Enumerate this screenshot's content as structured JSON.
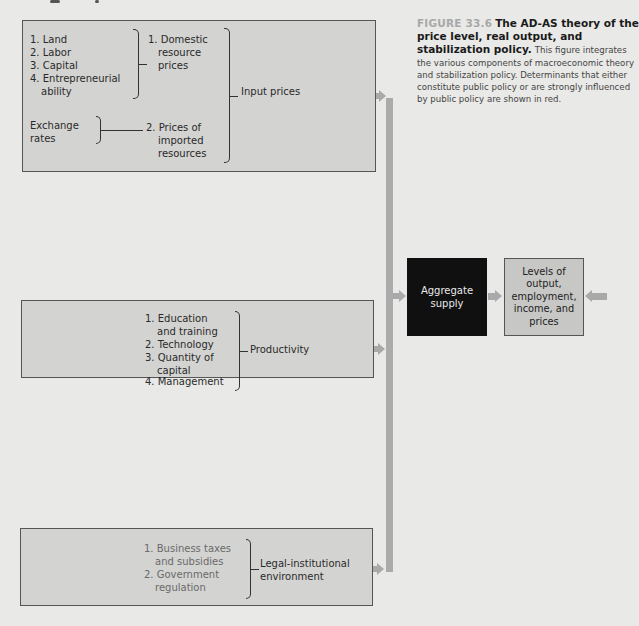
{
  "caption": {
    "figure_label": "FIGURE 33.6",
    "title": "The AD-AS theory of the price level, real output, and stabilization policy.",
    "body": "This figure integrates the various components of macroeconomic theory and stabilization policy. Determinants that either constitute public policy or are strongly influenced by public policy are shown in red."
  },
  "input_prices_box": {
    "resources": [
      "1. Land",
      "2. Labor",
      "3. Capital",
      "4. Entrepreneurial",
      "ability"
    ],
    "domestic_prices": [
      "1. Domestic",
      "resource",
      "prices"
    ],
    "exchange_rates": [
      "Exchange",
      "rates"
    ],
    "imported_prices": [
      "2. Prices of",
      "imported",
      "resources"
    ],
    "label": "Input prices"
  },
  "productivity_box": {
    "items": [
      "1. Education",
      "and training",
      "2. Technology",
      "3. Quantity of",
      "capital",
      "4. Management"
    ],
    "label": "Productivity"
  },
  "legal_box": {
    "items": [
      "1. Business taxes",
      "and subsidies",
      "2. Government",
      "regulation"
    ],
    "label_lines": [
      "Legal-institutional",
      "environment"
    ]
  },
  "aggregate_supply": {
    "lines": [
      "Aggregate",
      "supply"
    ]
  },
  "levels": {
    "lines": [
      "Levels of",
      "output,",
      "employment,",
      "income, and",
      "prices"
    ]
  },
  "colors": {
    "background": "#e9e9e7",
    "box_fill": "#d3d3d1",
    "aggregate_supply_fill": "#101010",
    "arrow": "#a9a9a9",
    "figure_label": "#a8a8a8"
  }
}
